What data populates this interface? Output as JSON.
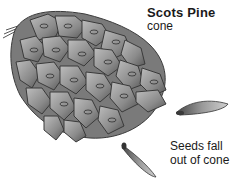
{
  "label": {
    "title": "Scots Pine",
    "subtitle": "cone",
    "caption_line1": "Seeds fall",
    "caption_line2": "out of cone"
  },
  "illustration": {
    "subject": "pine-cone",
    "seeds": 2,
    "colors": {
      "cone_fill": "#8a8a8a",
      "cone_dark": "#4a4a4a",
      "cone_light": "#c8c8c8",
      "background": "#ffffff"
    }
  }
}
